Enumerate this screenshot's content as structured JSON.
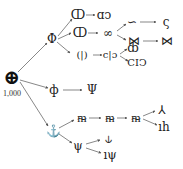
{
  "diagram": {
    "type": "symbol-derivation-tree",
    "root": {
      "glyph": "⊕",
      "label": "1,000",
      "x": 12,
      "y": 77
    },
    "nodes": [
      {
        "id": "a",
        "glyph": "Φ",
        "x": 52,
        "y": 39
      },
      {
        "id": "b",
        "glyph": "ф",
        "x": 54,
        "y": 90
      },
      {
        "id": "c",
        "glyph": "⚓",
        "x": 53,
        "y": 131
      },
      {
        "id": "a1",
        "glyph": "ↀ",
        "x": 78,
        "y": 15
      },
      {
        "id": "a1b",
        "glyph": "ɑↄ",
        "x": 104,
        "y": 15
      },
      {
        "id": "a2",
        "glyph": "ↀ",
        "x": 80,
        "y": 33
      },
      {
        "id": "a2b",
        "glyph": "∞",
        "x": 108,
        "y": 33
      },
      {
        "id": "a2b1",
        "glyph": "∽",
        "x": 132,
        "y": 22
      },
      {
        "id": "a2b1b",
        "glyph": "ς",
        "x": 166,
        "y": 22
      },
      {
        "id": "a2b2",
        "glyph": "⋈",
        "x": 134,
        "y": 41
      },
      {
        "id": "a2b2b",
        "glyph": "⋈",
        "x": 167,
        "y": 41
      },
      {
        "id": "a3",
        "glyph": "(|)",
        "x": 82,
        "y": 55
      },
      {
        "id": "a3b",
        "glyph": "c|ɔ",
        "x": 110,
        "y": 55
      },
      {
        "id": "a3b1",
        "glyph": "ȸ",
        "x": 133,
        "y": 48
      },
      {
        "id": "a3b2",
        "glyph": "CIↃ",
        "x": 137,
        "y": 63
      },
      {
        "id": "b1",
        "glyph": "Ψ",
        "x": 92,
        "y": 90
      },
      {
        "id": "c1",
        "glyph": "ᵯ",
        "x": 82,
        "y": 118
      },
      {
        "id": "c1b",
        "glyph": "ᵯ",
        "x": 110,
        "y": 118
      },
      {
        "id": "c1c",
        "glyph": "ᵯ",
        "x": 136,
        "y": 118
      },
      {
        "id": "c1c1",
        "glyph": "⅄",
        "x": 162,
        "y": 110
      },
      {
        "id": "c1c2",
        "glyph": "ıh",
        "x": 164,
        "y": 127
      },
      {
        "id": "c2",
        "glyph": "ψ",
        "x": 78,
        "y": 146
      },
      {
        "id": "c2a",
        "glyph": "⫝",
        "x": 108,
        "y": 139
      },
      {
        "id": "c2b",
        "glyph": "ıψ",
        "x": 110,
        "y": 155
      }
    ],
    "edges": [
      [
        18,
        72,
        47,
        43
      ],
      [
        20,
        80,
        48,
        88
      ],
      [
        20,
        82,
        48,
        126
      ],
      [
        58,
        36,
        72,
        19
      ],
      [
        58,
        39,
        71,
        33
      ],
      [
        57,
        42,
        70,
        53
      ],
      [
        86,
        15,
        95,
        15
      ],
      [
        88,
        33,
        98,
        33
      ],
      [
        93,
        55,
        102,
        55
      ],
      [
        117,
        31,
        126,
        24
      ],
      [
        117,
        35,
        126,
        40
      ],
      [
        140,
        22,
        156,
        22
      ],
      [
        143,
        41,
        158,
        41
      ],
      [
        120,
        54,
        127,
        49
      ],
      [
        120,
        56,
        128,
        61
      ],
      [
        63,
        90,
        82,
        90
      ],
      [
        59,
        128,
        74,
        120
      ],
      [
        59,
        134,
        72,
        143
      ],
      [
        89,
        118,
        101,
        118
      ],
      [
        117,
        118,
        127,
        118
      ],
      [
        143,
        116,
        155,
        111
      ],
      [
        143,
        119,
        157,
        125
      ],
      [
        86,
        144,
        100,
        140
      ],
      [
        86,
        148,
        101,
        153
      ]
    ]
  }
}
